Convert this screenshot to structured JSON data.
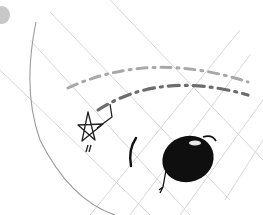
{
  "sketch": {
    "description": "Hand-drawn pencil doodle: curved arc boundary with a diagonal grid, two dashed arcing lines, a small star with a tail mark, and a black oval creature with a stick leg",
    "colors": {
      "background": "#ffffff",
      "grid_line": "#cfcfcf",
      "arc_line": "#9a9a9a",
      "dash_light": "#a8a8a8",
      "dash_dark": "#6a6a6a",
      "ink": "#111111",
      "corner_dot": "#c8c8c8"
    },
    "elements": [
      {
        "name": "corner-dot",
        "label": "gray circle at top-left corner"
      },
      {
        "name": "boundary-arc",
        "label": "curved arc line on the left"
      },
      {
        "name": "grid-lines",
        "label": "light diagonal grid lines"
      },
      {
        "name": "dashed-arc-upper",
        "label": "upper light dashed arc"
      },
      {
        "name": "dashed-arc-lower",
        "label": "lower dark dashed arc"
      },
      {
        "name": "star",
        "label": "hand-drawn star with two tick marks"
      },
      {
        "name": "stroke-mark",
        "label": "short curved black stroke"
      },
      {
        "name": "black-oval",
        "label": "black oval blob with highlight, antenna and stick leg"
      }
    ]
  }
}
